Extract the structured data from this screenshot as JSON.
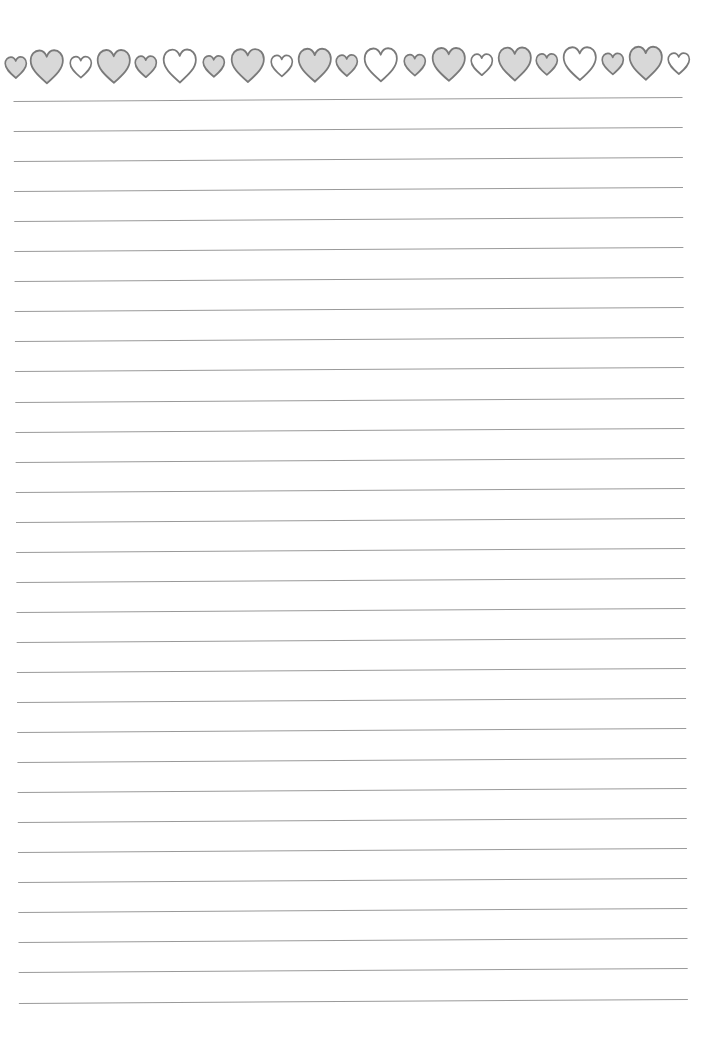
{
  "document": {
    "type": "lined-writing-paper",
    "background_color": "#ffffff"
  },
  "colors": {
    "heart_gray_fill": "#d8d8d8",
    "heart_white_fill": "#ffffff",
    "heart_stroke": "#7a7a7a",
    "line_color": "#9a9a9a"
  },
  "heart_border": {
    "icon": "heart-icon",
    "hearts": [
      {
        "size": "small",
        "fill": "gray",
        "cx": 18
      },
      {
        "size": "big",
        "fill": "gray",
        "cx": 49
      },
      {
        "size": "small",
        "fill": "white",
        "cx": 83
      },
      {
        "size": "big",
        "fill": "gray",
        "cx": 116
      },
      {
        "size": "small",
        "fill": "gray",
        "cx": 148
      },
      {
        "size": "big",
        "fill": "white",
        "cx": 182
      },
      {
        "size": "small",
        "fill": "gray",
        "cx": 216
      },
      {
        "size": "big",
        "fill": "gray",
        "cx": 250
      },
      {
        "size": "small",
        "fill": "white",
        "cx": 284
      },
      {
        "size": "big",
        "fill": "gray",
        "cx": 317
      },
      {
        "size": "small",
        "fill": "gray",
        "cx": 349
      },
      {
        "size": "big",
        "fill": "white",
        "cx": 383
      },
      {
        "size": "small",
        "fill": "gray",
        "cx": 417
      },
      {
        "size": "big",
        "fill": "gray",
        "cx": 451
      },
      {
        "size": "small",
        "fill": "white",
        "cx": 484
      },
      {
        "size": "big",
        "fill": "gray",
        "cx": 517
      },
      {
        "size": "small",
        "fill": "gray",
        "cx": 549
      },
      {
        "size": "big",
        "fill": "white",
        "cx": 582
      },
      {
        "size": "small",
        "fill": "gray",
        "cx": 615
      },
      {
        "size": "big",
        "fill": "gray",
        "cx": 648
      },
      {
        "size": "small",
        "fill": "white",
        "cx": 681
      }
    ]
  },
  "ruled_lines": {
    "count": 31,
    "first_y": 99,
    "spacing": 30.05,
    "left": 16,
    "right": 685
  }
}
